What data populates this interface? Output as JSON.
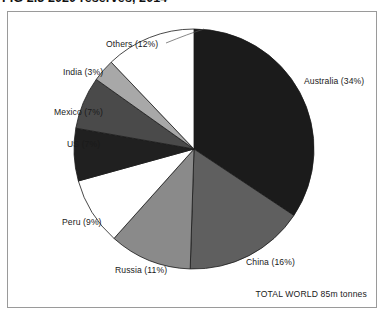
{
  "title": "FIG 2.3  2020 reserves, 2014",
  "frame": {
    "border_color": "#9a9a9a",
    "background": "#ffffff"
  },
  "total_caption": "TOTAL WORLD 85m tonnes",
  "chart_data": {
    "type": "pie",
    "title": "FIG 2.3  2020 reserves, 2014",
    "xlabel": "",
    "ylabel": "",
    "legend_position": "callout-labels",
    "grid": false,
    "total_label": "TOTAL WORLD 85m tonnes",
    "total_value": "85m tonnes",
    "units": "percent of world reserves",
    "categories": [
      "Australia",
      "China",
      "Russia",
      "Peru",
      "US",
      "Mexico",
      "India",
      "Others"
    ],
    "values": [
      34,
      16,
      11,
      9,
      7,
      7,
      3,
      12
    ],
    "labels": [
      "Australia (34%)",
      "China (16%)",
      "Russia (11%)",
      "Peru (9%)",
      "US (7%)",
      "Mexico (7%)",
      "India (3%)",
      "Others (12%)"
    ],
    "colors": [
      "#1b1b1b",
      "#5f5f5f",
      "#8a8a8a",
      "#ffffff",
      "#202020",
      "#4a4a4a",
      "#a8a8a8",
      "#ffffff"
    ],
    "start_angle_deg": 0,
    "direction": "clockwise"
  },
  "slices": [
    {
      "name": "australia",
      "label": "Australia (34%)",
      "percent": 34,
      "color": "#1b1b1b",
      "label_x": 296,
      "label_y": 64
    },
    {
      "name": "china",
      "label": "China (16%)",
      "percent": 16,
      "color": "#5f5f5f",
      "label_x": 238,
      "label_y": 245
    },
    {
      "name": "russia",
      "label": "Russia (11%)",
      "percent": 11,
      "color": "#8a8a8a",
      "label_x": 107,
      "label_y": 253
    },
    {
      "name": "peru",
      "label": "Peru (9%)",
      "percent": 9,
      "color": "#ffffff",
      "label_x": 54,
      "label_y": 205
    },
    {
      "name": "us",
      "label": "US (7%)",
      "percent": 7,
      "color": "#202020",
      "label_x": 59,
      "label_y": 127
    },
    {
      "name": "mexico",
      "label": "Mexico (7%)",
      "percent": 7,
      "color": "#4a4a4a",
      "label_x": 46,
      "label_y": 95
    },
    {
      "name": "india",
      "label": "India (3%)",
      "percent": 3,
      "color": "#a8a8a8",
      "label_x": 55,
      "label_y": 55
    },
    {
      "name": "others",
      "label": "Others (12%)",
      "percent": 12,
      "color": "#ffffff",
      "label_x": 98,
      "label_y": 27
    }
  ]
}
